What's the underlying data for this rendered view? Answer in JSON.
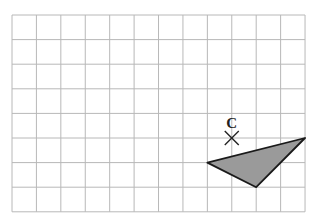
{
  "grid": {
    "left": 12,
    "top": 15,
    "cell_w": 24.42,
    "cell_h": 24.6,
    "cols": 12,
    "rows": 8,
    "line_color": "#b8b8b8"
  },
  "point_c": {
    "label": "C",
    "grid_x": 9,
    "grid_y": 5,
    "marker": "cross-icon",
    "color": "#222222"
  },
  "triangle": {
    "vertices": [
      [
        8,
        6
      ],
      [
        12,
        5
      ],
      [
        10,
        7
      ]
    ],
    "fill": "#9a9a9a",
    "stroke": "#1a1a1a"
  }
}
